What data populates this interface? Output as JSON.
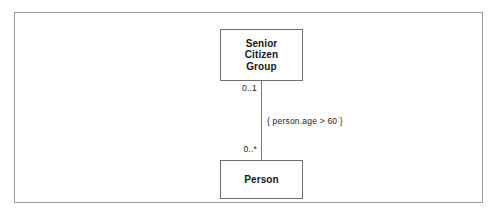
{
  "diagram": {
    "type": "uml-class-diagram",
    "frame": {
      "border_color": "#9a9a9a",
      "background": "#ffffff"
    },
    "classes": [
      {
        "id": "senior-citizen-group",
        "name": "Senior\nCitizen\nGroup",
        "border_color": "#6e6e6e",
        "text_color": "#161616"
      },
      {
        "id": "person",
        "name": "Person",
        "border_color": "#6e6e6e",
        "text_color": "#161616"
      }
    ],
    "association": {
      "line_color": "#7a7a7a",
      "source_multiplicity": "0..1",
      "target_multiplicity": "0..*",
      "constraint": "{ person.age > 60 }"
    }
  }
}
